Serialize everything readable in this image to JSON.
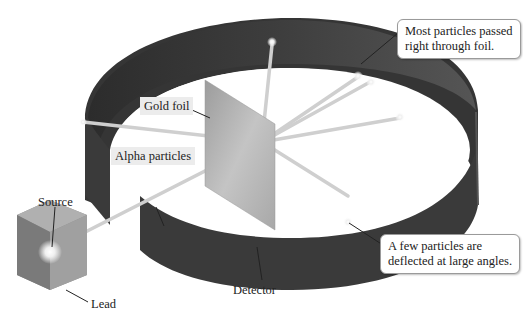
{
  "figure": {
    "labels": {
      "source": "Source",
      "lead": "Lead",
      "gold_foil": "Gold foil",
      "alpha_particles": "Alpha particles",
      "detector": "Detector"
    },
    "callouts": {
      "most_passed": {
        "line1": "Most particles passed",
        "line2": "right through foil."
      },
      "few_deflected": {
        "line1": "A few particles are",
        "line2": "deflected at large angles."
      }
    },
    "colors": {
      "detector_ring": "#3a3a3a",
      "beam": "#c9c9c9",
      "foil": "#b0b0b0",
      "lead_block": "#8a8a8a",
      "label_bg": "#ececec"
    }
  }
}
